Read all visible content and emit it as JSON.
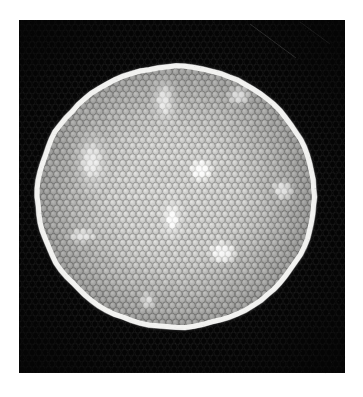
{
  "image": {
    "title": "Fiber optic bundle cross-section",
    "width": 363,
    "height": 397,
    "background_color": "#ffffff",
    "modality": "transmitted-light micrograph"
  },
  "frame": {
    "name": "dark-field-frame",
    "x": 19,
    "y": 20,
    "width": 326,
    "height": 353,
    "fill_color": "#050505",
    "texture_visible": true,
    "texture_color": "#171717",
    "note": "Faint honeycomb texture continues into the dark surround"
  },
  "specimen": {
    "name": "fiber-bundle-disc",
    "shape": "disc",
    "center_x": 176,
    "center_y": 197,
    "radius_x": 139,
    "radius_y": 131,
    "edge_rim_color": "#f2f2f0",
    "body_color": "#c3c3c1",
    "body_color_dark": "#a8a8a6",
    "rim_width": 5,
    "boundary_irregularity": 3.5
  },
  "lattice": {
    "name": "honeycomb-fiber-lattice",
    "arrangement": "hexagonal-close-packed",
    "cell_pitch_x": 6.6,
    "cell_pitch_y": 5.7,
    "cell_radius_x": 3.0,
    "cell_radius_y": 3.4,
    "cell_core_color": "#cfcfcd",
    "cell_wall_color": "#9a9a98",
    "approx_cell_count": 1760,
    "row_offset": "staggered"
  },
  "shading": {
    "vignette_strength": 0.18,
    "highlight_center_x": 150,
    "highlight_center_y": 150,
    "noise_amplitude": 7
  },
  "bright_spots": [
    {
      "id": 1,
      "label": "spot-top-center",
      "x": 164,
      "y": 100,
      "radius_x": 5,
      "radius_y": 10,
      "intensity": 1.0
    },
    {
      "id": 2,
      "label": "spot-top-right",
      "x": 239,
      "y": 96,
      "radius_x": 8,
      "radius_y": 7,
      "intensity": 1.0
    },
    {
      "id": 3,
      "label": "spot-left-upper",
      "x": 91,
      "y": 161,
      "radius_x": 7,
      "radius_y": 13,
      "intensity": 1.0
    },
    {
      "id": 4,
      "label": "spot-center",
      "x": 201,
      "y": 170,
      "radius_x": 8,
      "radius_y": 8,
      "intensity": 1.0
    },
    {
      "id": 5,
      "label": "spot-right",
      "x": 283,
      "y": 190,
      "radius_x": 8,
      "radius_y": 7,
      "intensity": 1.0
    },
    {
      "id": 6,
      "label": "spot-center-lower",
      "x": 172,
      "y": 219,
      "radius_x": 5,
      "radius_y": 9,
      "intensity": 1.0
    },
    {
      "id": 7,
      "label": "spot-left-lower",
      "x": 81,
      "y": 236,
      "radius_x": 10,
      "radius_y": 5,
      "intensity": 1.0
    },
    {
      "id": 8,
      "label": "spot-lower-right",
      "x": 223,
      "y": 253,
      "radius_x": 10,
      "radius_y": 8,
      "intensity": 1.0
    },
    {
      "id": 9,
      "label": "spot-bottom-center",
      "x": 148,
      "y": 301,
      "radius_x": 5,
      "radius_y": 6,
      "intensity": 0.85
    }
  ],
  "scratches": [
    {
      "id": 1,
      "x1": 250,
      "y1": 24,
      "x2": 296,
      "y2": 58,
      "opacity": 0.22
    },
    {
      "id": 2,
      "x1": 300,
      "y1": 22,
      "x2": 330,
      "y2": 44,
      "opacity": 0.12
    }
  ]
}
